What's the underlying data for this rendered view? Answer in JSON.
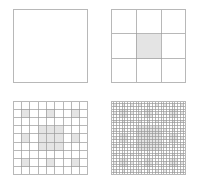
{
  "figure": {
    "width": 199,
    "height": 185,
    "background": "#ffffff"
  },
  "style": {
    "grid_line_color": "#9a9a9a",
    "outer_border_color": "#b8b8b8",
    "fill_color": "#e4e4e4",
    "empty_color": "#ffffff",
    "grid_line_width": 0.7,
    "outer_border_width": 1.0
  },
  "chart_data": {
    "type": "diagram",
    "title": "",
    "panels": [
      {
        "name": "iteration-0",
        "iteration": 0,
        "divisions": 1,
        "x": 13,
        "y": 9,
        "width": 75,
        "height": 74,
        "filled_cells": [],
        "show_grid": false
      },
      {
        "name": "iteration-1",
        "iteration": 1,
        "divisions": 3,
        "x": 111,
        "y": 9,
        "width": 75,
        "height": 74,
        "filled_cells": [
          [
            1,
            1
          ]
        ],
        "show_grid": true
      },
      {
        "name": "iteration-2",
        "iteration": 2,
        "divisions": 9,
        "x": 13,
        "y": 101,
        "width": 75,
        "height": 74,
        "filled_cells": [
          [
            1,
            1
          ],
          [
            1,
            4
          ],
          [
            1,
            7
          ],
          [
            4,
            1
          ],
          [
            4,
            7
          ],
          [
            7,
            1
          ],
          [
            7,
            4
          ],
          [
            7,
            7
          ],
          [
            3,
            3
          ],
          [
            3,
            4
          ],
          [
            3,
            5
          ],
          [
            4,
            3
          ],
          [
            4,
            4
          ],
          [
            4,
            5
          ],
          [
            5,
            3
          ],
          [
            5,
            4
          ],
          [
            5,
            5
          ]
        ],
        "show_grid": true
      },
      {
        "name": "iteration-3",
        "iteration": 3,
        "divisions": 27,
        "x": 111,
        "y": 101,
        "width": 75,
        "height": 74,
        "filled_cells": "generated-recursively",
        "show_grid": true
      }
    ]
  }
}
